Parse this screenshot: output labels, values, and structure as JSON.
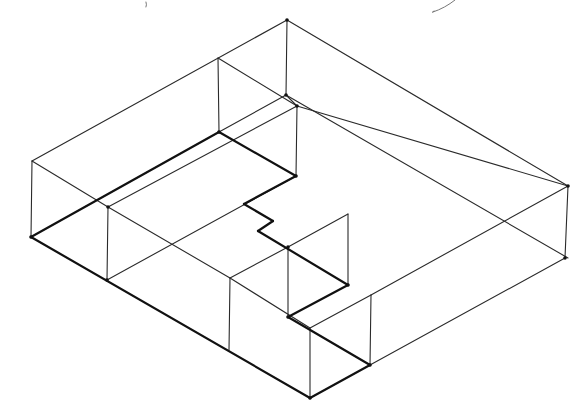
{
  "figure": {
    "stroke_color": "#111111",
    "background": "#ffffff"
  },
  "outer_box": {
    "top_vertices": [
      [
        32,
        161
      ],
      [
        287,
        20
      ],
      [
        568,
        186
      ],
      [
        310,
        328
      ]
    ],
    "bottom_vertices": [
      [
        31,
        237
      ],
      [
        565,
        258
      ],
      [
        310,
        398
      ]
    ]
  },
  "thin_lines": [
    [
      [
        32,
        161
      ],
      [
        287,
        20
      ]
    ],
    [
      [
        287,
        20
      ],
      [
        568,
        186
      ]
    ],
    [
      [
        218,
        58
      ],
      [
        297,
        106
      ]
    ],
    [
      [
        32,
        161
      ],
      [
        108,
        207
      ]
    ],
    [
      [
        108,
        207
      ],
      [
        230,
        278
      ]
    ],
    [
      [
        230,
        278
      ],
      [
        310,
        328
      ]
    ],
    [
      [
        287,
        20
      ],
      [
        286,
        95
      ]
    ],
    [
      [
        218,
        58
      ],
      [
        219,
        132
      ]
    ],
    [
      [
        297,
        106
      ],
      [
        296,
        176
      ]
    ],
    [
      [
        32,
        161
      ],
      [
        31,
        237
      ]
    ],
    [
      [
        108,
        207
      ],
      [
        107,
        280
      ]
    ],
    [
      [
        230,
        278
      ],
      [
        229,
        350
      ]
    ],
    [
      [
        288,
        247
      ],
      [
        288,
        317
      ]
    ],
    [
      [
        348,
        214
      ],
      [
        348,
        285
      ]
    ],
    [
      [
        310,
        328
      ],
      [
        310,
        398
      ]
    ],
    [
      [
        371,
        295
      ],
      [
        370,
        365
      ]
    ],
    [
      [
        568,
        186
      ],
      [
        565,
        258
      ]
    ],
    [
      [
        108,
        207
      ],
      [
        297,
        106
      ]
    ],
    [
      [
        107,
        280
      ],
      [
        296,
        176
      ]
    ],
    [
      [
        219,
        132
      ],
      [
        286,
        95
      ]
    ],
    [
      [
        230,
        278
      ],
      [
        288,
        247
      ]
    ],
    [
      [
        288,
        247
      ],
      [
        348,
        214
      ]
    ],
    [
      [
        297,
        106
      ],
      [
        568,
        186
      ]
    ],
    [
      [
        310,
        328
      ],
      [
        371,
        295
      ]
    ],
    [
      [
        371,
        295
      ],
      [
        568,
        186
      ]
    ],
    [
      [
        370,
        365
      ],
      [
        565,
        258
      ]
    ],
    [
      [
        286,
        95
      ],
      [
        297,
        106
      ]
    ],
    [
      [
        286,
        95
      ],
      [
        568,
        258
      ]
    ]
  ],
  "thick_lines": [
    [
      [
        31,
        237
      ],
      [
        219,
        132
      ]
    ],
    [
      [
        219,
        132
      ],
      [
        296,
        176
      ]
    ],
    [
      [
        296,
        176
      ],
      [
        244,
        204
      ]
    ],
    [
      [
        244,
        204
      ],
      [
        273,
        221
      ]
    ],
    [
      [
        273,
        221
      ],
      [
        258,
        231
      ]
    ],
    [
      [
        258,
        231
      ],
      [
        348,
        285
      ]
    ],
    [
      [
        348,
        285
      ],
      [
        288,
        317
      ]
    ],
    [
      [
        288,
        317
      ],
      [
        370,
        365
      ]
    ],
    [
      [
        31,
        237
      ],
      [
        310,
        398
      ]
    ],
    [
      [
        310,
        398
      ],
      [
        370,
        365
      ]
    ]
  ],
  "vertex_dots": [
    [
      31,
      237
    ],
    [
      107,
      280
    ],
    [
      108,
      207
    ],
    [
      219,
      132
    ],
    [
      296,
      176
    ],
    [
      286,
      95
    ],
    [
      297,
      106
    ],
    [
      288,
      247
    ],
    [
      348,
      285
    ],
    [
      288,
      317
    ],
    [
      370,
      365
    ],
    [
      310,
      398
    ],
    [
      568,
      186
    ],
    [
      565,
      258
    ],
    [
      287,
      20
    ]
  ],
  "handwriting_strokes": [
    "M 146 2 Q 147 5 146 7",
    "M 433 12 Q 445 8 455 0 M 433 12 Q 431 13 434 11"
  ]
}
